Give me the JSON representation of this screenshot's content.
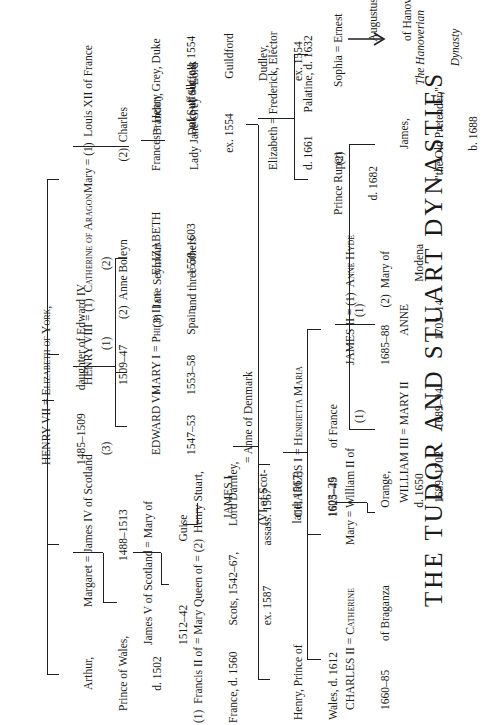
{
  "title": "THE TUDOR AND STUART DYNASTIES",
  "nodes": {
    "henry7": [
      "HENRY VII = Elizabeth of York,",
      "1485–1509        daughter of Edward IV"
    ],
    "arthur": [
      "Arthur,",
      "Prince of Wales,",
      "d. 1502"
    ],
    "margaret": [
      "Margaret = James IV of Scotland",
      "                1488–1513"
    ],
    "henry8": [
      "HENRY VIII = (1)  Catherine of Aragon",
      "1509–47         (2)  Anne Boleyn",
      "                    (3)  Jane Seymour",
      "                          and three others"
    ],
    "mary_tudor": [
      "Mary = (1)  Louis XII of France",
      "           (2)  Charles",
      "                    Brandon,",
      "                    Duke of Suffolk"
    ],
    "james5": [
      "James V of Scotland = Mary of",
      "1512–42                      Guise"
    ],
    "edward6": [
      "EDWARD VI",
      "1547–53"
    ],
    "mary1": [
      "MARY I = Philip II of",
      "1553–58       Spain"
    ],
    "elizabeth1": [
      "ELIZABETH",
      "1558–1603"
    ],
    "frances": [
      "Frances = Henry Grey, Duke",
      "               of Suffolk, ex. 1554"
    ],
    "mary_qos": [
      "(1)  Francis II of = Mary Queen of = (2)  Henry Stuart,",
      "France, d. 1560         Scots, 1542–67,         Lord Darnley,",
      "                                  ex. 1587              assass. 1567"
    ],
    "jane_grey": [
      "Lady Jane Grey = Lord",
      "      ex. 1554            Guildford",
      "                               Dudley,",
      "                               ex. 1554"
    ],
    "james1": [
      "JAMES I",
      "(VI of Scot-",
      "land; 1567)",
      "1603–25"
    ],
    "anne_denmark": [
      "= Anne of Denmark"
    ],
    "henry_pow": [
      "Henry, Prince of",
      "Wales, d. 1612"
    ],
    "charles1": [
      "CHARLES I = Henrietta Maria",
      "1625–49          of France"
    ],
    "elizabeth_boh": [
      "Elizabeth = Frederick, Elector",
      "d. 1661        Palatine, d. 1632"
    ],
    "charles2": [
      "CHARLES II = Catherine",
      "1660–85          of Braganza"
    ],
    "mary_orange": [
      "Mary = William II of",
      "             Orange,",
      "             d. 1650"
    ],
    "james2": [
      "JAMES II = (1)  Anne Hyde",
      "1685–88      (2)  Mary of",
      "                             Modena"
    ],
    "rupert": [
      "Prince Rupert",
      "d. 1682"
    ],
    "sophia": [
      "Sophia = Ernest",
      "                Augustus",
      "                of Hanover"
    ],
    "william3": [
      "WILLIAM III = MARY II",
      "1689–1702        1689–94"
    ],
    "anne": [
      "ANNE",
      "1702–14"
    ],
    "james_op": [
      "James,",
      "\"the Old Pretender,\"",
      "b. 1688"
    ],
    "hanoverian": [
      "The Hanoverian",
      "Dynasty"
    ]
  },
  "markers": {
    "m3": "(3)",
    "m1a": "(1)",
    "m2a": "(2)",
    "m1b": "(1)",
    "m1c": "(1)",
    "m2b": "(2)"
  },
  "icons": {
    "arrow": "arrow-right-icon"
  }
}
